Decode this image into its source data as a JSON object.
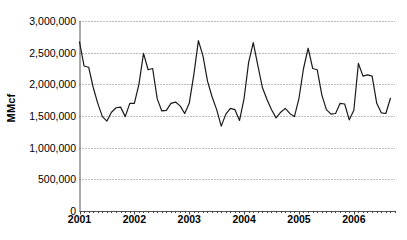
{
  "chart_data": {
    "type": "line",
    "title": "",
    "subtitle": "",
    "xlabel": "",
    "ylabel": "MMcf",
    "ylim": [
      0,
      3000000
    ],
    "xlim": [
      2001.0,
      2006.75
    ],
    "grid": true,
    "grid_style": "dotted-horizontal",
    "legend": false,
    "legend_position": "none",
    "y_ticks": [
      0,
      500000,
      1000000,
      1500000,
      2000000,
      2500000,
      3000000
    ],
    "y_tick_labels": [
      "0",
      "500,000",
      "1,000,000",
      "1,500,000",
      "2,000,000",
      "2,500,000",
      "3,000,000"
    ],
    "x_ticks": [
      2001,
      2002,
      2003,
      2004,
      2005,
      2006
    ],
    "x_tick_labels": [
      "2001",
      "2002",
      "2003",
      "2004",
      "2005",
      "2006"
    ],
    "x_minor_tick_interval_years": 0.0833,
    "line_color": "#1a1a1a",
    "line_width": 1.2,
    "markers": false,
    "series": [
      {
        "name": "MMcf",
        "x": [
          2001.0,
          2001.083,
          2001.167,
          2001.25,
          2001.333,
          2001.417,
          2001.5,
          2001.583,
          2001.667,
          2001.75,
          2001.833,
          2001.917,
          2002.0,
          2002.083,
          2002.167,
          2002.25,
          2002.333,
          2002.417,
          2002.5,
          2002.583,
          2002.667,
          2002.75,
          2002.833,
          2002.917,
          2003.0,
          2003.083,
          2003.167,
          2003.25,
          2003.333,
          2003.417,
          2003.5,
          2003.583,
          2003.667,
          2003.75,
          2003.833,
          2003.917,
          2004.0,
          2004.083,
          2004.167,
          2004.25,
          2004.333,
          2004.417,
          2004.5,
          2004.583,
          2004.667,
          2004.75,
          2004.833,
          2004.917,
          2005.0,
          2005.083,
          2005.167,
          2005.25,
          2005.333,
          2005.417,
          2005.5,
          2005.583,
          2005.667,
          2005.75,
          2005.833,
          2005.917,
          2006.0,
          2006.083,
          2006.167,
          2006.25,
          2006.333,
          2006.417,
          2006.5,
          2006.583,
          2006.667
        ],
        "values": [
          2670000,
          2290000,
          2270000,
          1950000,
          1700000,
          1490000,
          1420000,
          1560000,
          1630000,
          1640000,
          1490000,
          1700000,
          1700000,
          2000000,
          2490000,
          2230000,
          2250000,
          1770000,
          1580000,
          1590000,
          1700000,
          1720000,
          1660000,
          1540000,
          1700000,
          2150000,
          2690000,
          2450000,
          2050000,
          1800000,
          1600000,
          1340000,
          1530000,
          1620000,
          1600000,
          1430000,
          1780000,
          2350000,
          2660000,
          2300000,
          1950000,
          1760000,
          1600000,
          1470000,
          1560000,
          1620000,
          1540000,
          1490000,
          1780000,
          2250000,
          2570000,
          2250000,
          2230000,
          1830000,
          1600000,
          1530000,
          1540000,
          1700000,
          1690000,
          1440000,
          1590000,
          2330000,
          2130000,
          2150000,
          2130000,
          1700000,
          1550000,
          1540000,
          1780000
        ]
      }
    ]
  }
}
